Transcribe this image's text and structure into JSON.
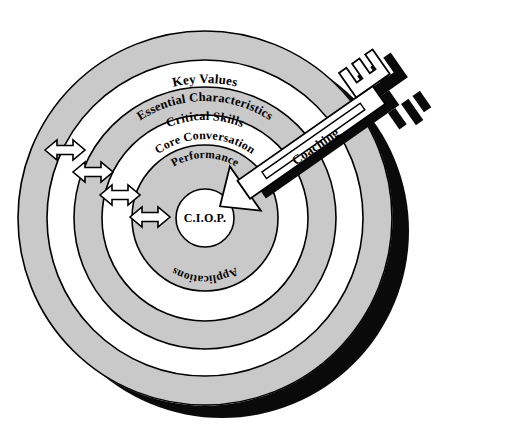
{
  "figure": {
    "type": "concentric-target-diagram",
    "background_color": "#ffffff",
    "ring_fill_gray": "#c9c9c9",
    "ring_fill_white": "#ffffff",
    "outline_color": "#000000",
    "shadow_color": "#000000",
    "center_label": "C.I.O.P.",
    "rings": [
      {
        "id": "key-values",
        "label": "Key Values",
        "fill": "gray",
        "level": 1
      },
      {
        "id": "essential-characteristics",
        "label": "Essential Characteristics",
        "fill": "white",
        "level": 2
      },
      {
        "id": "critical-skills",
        "label": "Critical Skills",
        "fill": "gray",
        "level": 3
      },
      {
        "id": "core-conversation",
        "label": "Core Conversation",
        "fill": "white",
        "level": 4
      },
      {
        "id": "performance",
        "label": "Performance",
        "fill": "gray",
        "level": 5
      },
      {
        "id": "applications",
        "label": "Applications",
        "fill": "gray",
        "level": 5
      }
    ],
    "key": {
      "label": "Coaching",
      "description": "key-with-arrow-tip",
      "teeth_count": 3,
      "has_shadow": true
    },
    "arrows": {
      "count": 4,
      "style": "double-headed",
      "fill": "#ffffff",
      "stroke": "#000000"
    }
  }
}
